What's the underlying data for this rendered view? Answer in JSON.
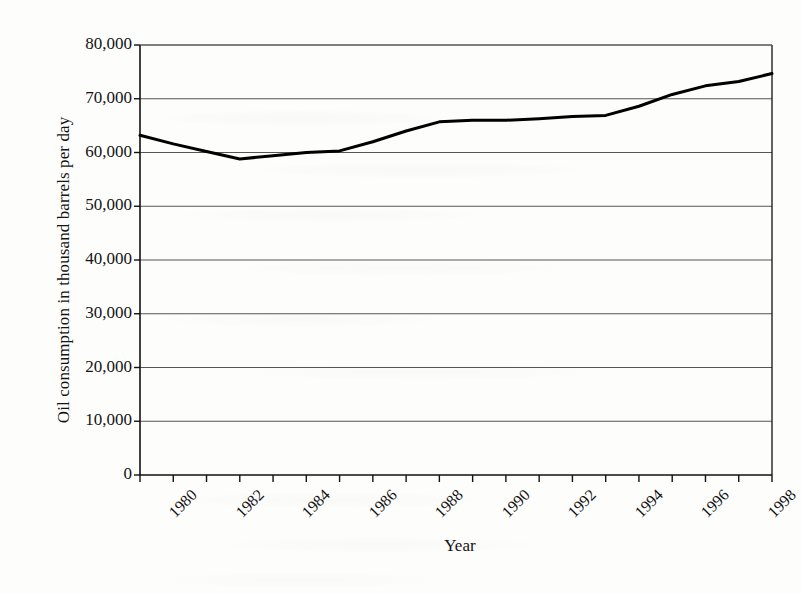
{
  "figure": {
    "background_color": "#fdfdfc",
    "ink_color": "#111111",
    "gridline_color": "#555555",
    "series_color": "#000000"
  },
  "axis_titles": {
    "y": "Oil consumption in thousand barrels per day",
    "x": "Year"
  },
  "chart_data": {
    "type": "line",
    "title": "",
    "subtitle": "",
    "xlabel": "Year",
    "ylabel": "Oil consumption in thousand barrels per day",
    "xlim": [
      1980,
      1999
    ],
    "ylim": [
      0,
      80000
    ],
    "grid": true,
    "grid_axis": "y",
    "legend": false,
    "legend_position": "none",
    "y_ticks": [
      0,
      10000,
      20000,
      30000,
      40000,
      50000,
      60000,
      70000,
      80000
    ],
    "y_tick_labels": [
      "0",
      "10,000",
      "20,000",
      "30,000",
      "40,000",
      "50,000",
      "60,000",
      "70,000",
      "80,000"
    ],
    "x_ticks": [
      1980,
      1981,
      1982,
      1983,
      1984,
      1985,
      1986,
      1987,
      1988,
      1989,
      1990,
      1991,
      1992,
      1993,
      1994,
      1995,
      1996,
      1997,
      1998,
      1999
    ],
    "x_tick_labels_shown": [
      "1980",
      "1982",
      "1984",
      "1986",
      "1988",
      "1990",
      "1992",
      "1994",
      "1996",
      "1998"
    ],
    "x_tick_label_rotation": -45,
    "x": [
      1980,
      1981,
      1982,
      1983,
      1984,
      1985,
      1986,
      1987,
      1988,
      1989,
      1990,
      1991,
      1992,
      1993,
      1994,
      1995,
      1996,
      1997,
      1998,
      1999
    ],
    "values": [
      63200,
      61600,
      60200,
      58800,
      59400,
      60000,
      60300,
      62000,
      64000,
      65700,
      66000,
      66000,
      66300,
      66700,
      66900,
      68600,
      70800,
      72400,
      73200,
      74700
    ],
    "series": [
      {
        "name": "Oil consumption",
        "color": "#000000",
        "line_width": 3,
        "markers": false,
        "values": [
          63200,
          61600,
          60200,
          58800,
          59400,
          60000,
          60300,
          62000,
          64000,
          65700,
          66000,
          66000,
          66300,
          66700,
          66900,
          68600,
          70800,
          72400,
          73200,
          74700
        ]
      }
    ],
    "annotations": []
  }
}
